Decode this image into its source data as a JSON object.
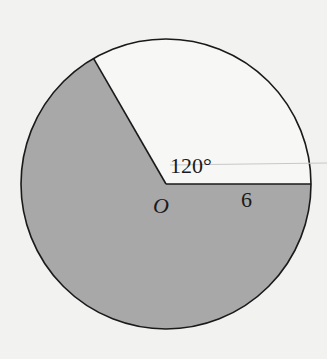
{
  "diagram": {
    "type": "circle-sector",
    "center_label": "O",
    "angle_label": "120°",
    "radius_label": "6",
    "colors": {
      "background": "#f2f2f0",
      "shaded": "#a8a8a8",
      "unshaded": "#f7f7f5",
      "stroke": "#1a1a1a"
    },
    "geometry": {
      "center": [
        166,
        184
      ],
      "radius": 145,
      "unshaded_sector_degrees": 120,
      "shaded_sector_degrees": 240
    }
  }
}
